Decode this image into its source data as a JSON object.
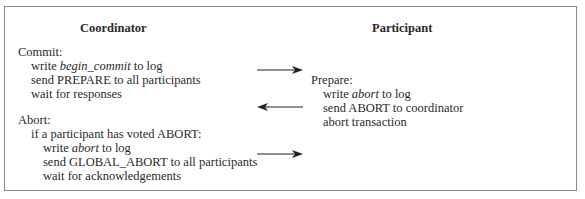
{
  "coordinator": {
    "title": "Coordinator",
    "commit_label": "Commit:",
    "commit_steps": [
      {
        "pre": "write ",
        "em": "begin_commit",
        "post": " to log"
      },
      {
        "pre": "send PREPARE to all participants",
        "em": "",
        "post": ""
      },
      {
        "pre": "wait for responses",
        "em": "",
        "post": ""
      }
    ],
    "abort_label": "Abort:",
    "abort_condition": "if a participant has voted ABORT:",
    "abort_steps": [
      {
        "pre": "write ",
        "em": "abort",
        "post": " to log"
      },
      {
        "pre": "send GLOBAL_ABORT to all participants",
        "em": "",
        "post": ""
      },
      {
        "pre": "wait for acknowledgements",
        "em": "",
        "post": ""
      }
    ]
  },
  "participant": {
    "title": "Participant",
    "prepare_label": "Prepare:",
    "prepare_steps": [
      {
        "pre": "write ",
        "em": "abort",
        "post": " to log"
      },
      {
        "pre": "send ABORT to coordinator",
        "em": "",
        "post": ""
      },
      {
        "pre": "abort transaction",
        "em": "",
        "post": ""
      }
    ]
  },
  "arrows": [
    {
      "direction": "right",
      "meaning": "PREPARE"
    },
    {
      "direction": "left",
      "meaning": "ABORT"
    },
    {
      "direction": "right",
      "meaning": "GLOBAL_ABORT"
    }
  ],
  "colors": {
    "text": "#2a2a2a",
    "border": "#8a8a8a",
    "arrow": "#222222"
  }
}
